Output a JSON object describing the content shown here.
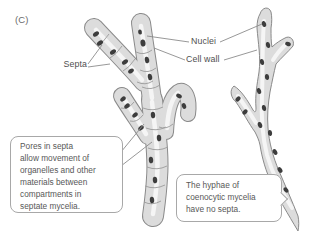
{
  "figure": {
    "panel_label": "(C)",
    "labels": {
      "septa": "Septa",
      "nuclei": "Nuclei",
      "cell_wall": "Cell wall"
    },
    "callouts": {
      "septa_pores": "Pores in septa\nallow movement of\norganelles and other\nmaterials between\ncompartments in\nseptate mycelia.",
      "coenocytic": "The hyphae of\ncoenocytic mycelia\nhave no septa."
    },
    "colors": {
      "background": "#ffffff",
      "hypha_fill": "#dcdcdc",
      "hypha_outline": "#8a8a8a",
      "hypha_highlight": "#ffffff",
      "nucleus": "#3d3d3d",
      "septum_line": "#9b9b9b",
      "leader_line": "#8c8c8c",
      "callout_border": "#a8a8a8",
      "label_text": "#4f4f4f",
      "callout_text": "#585858"
    }
  }
}
